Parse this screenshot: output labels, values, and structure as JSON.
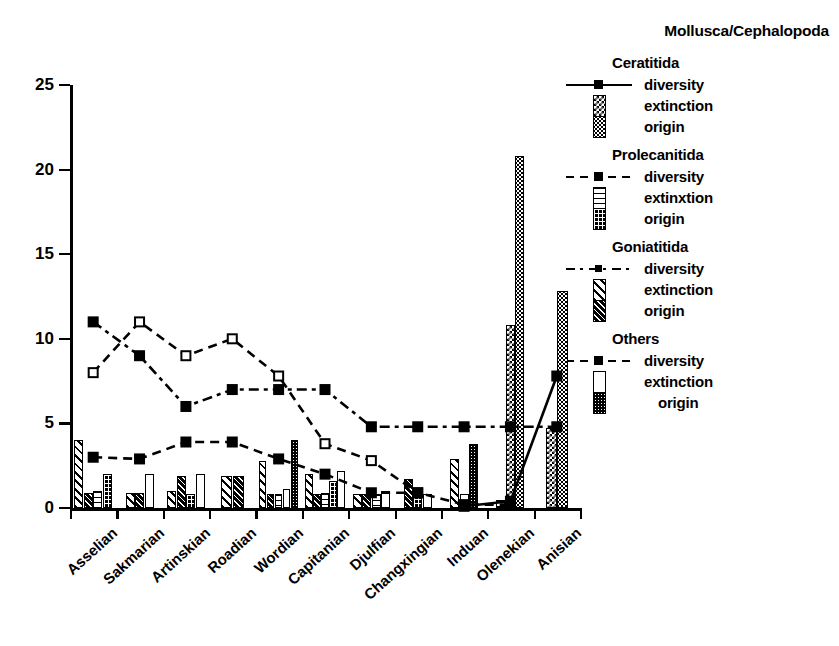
{
  "legend": {
    "title": "Mollusca/Cephalopoda",
    "groups": [
      {
        "name": "Ceratitida",
        "entries": [
          {
            "label": "diversity",
            "key": "line-solid-square",
            "icon": "solid-line-marker-icon"
          },
          {
            "label": "extinction",
            "key": "swatch-checker",
            "icon": "checker-swatch-icon"
          },
          {
            "label": "origin",
            "key": "swatch-dark-dotted",
            "icon": "dark-dotted-swatch-icon"
          }
        ]
      },
      {
        "name": "Prolecanitida",
        "entries": [
          {
            "label": "diversity",
            "key": "line-dash-square",
            "icon": "dashed-line-marker-icon"
          },
          {
            "label": "extinxtion",
            "key": "swatch-hlines",
            "icon": "horizontal-lines-swatch-icon"
          },
          {
            "label": "origin",
            "key": "swatch-dark-grid",
            "icon": "dark-grid-swatch-icon"
          }
        ]
      },
      {
        "name": "Goniatitida",
        "entries": [
          {
            "label": "diversity",
            "key": "line-dashdot-square",
            "icon": "dash-dot-line-marker-icon"
          },
          {
            "label": "extinction",
            "key": "swatch-diagonal",
            "icon": "diagonal-hatch-swatch-icon"
          },
          {
            "label": "origin",
            "key": "swatch-dark-diagonal",
            "icon": "dark-diagonal-swatch-icon"
          }
        ]
      },
      {
        "name": "Others",
        "entries": [
          {
            "label": "diversity",
            "key": "line-dash-square2",
            "icon": "dashed-line-marker-icon"
          },
          {
            "label": "extinction",
            "key": "swatch-white",
            "icon": "white-swatch-icon"
          },
          {
            "label": "origin",
            "key": "swatch-dark-stipple",
            "icon": "dark-stipple-swatch-icon"
          }
        ]
      }
    ]
  },
  "chart_data": {
    "type": "bar",
    "title": "Mollusca/Cephalopoda",
    "xlabel": "",
    "ylabel": "",
    "ylim": [
      0,
      25
    ],
    "yticks": [
      0,
      5,
      10,
      15,
      20,
      25
    ],
    "grid": false,
    "legend_position": "right",
    "categories": [
      "Asselian",
      "Sakmarian",
      "Artinskian",
      "Roadian",
      "Wordian",
      "Capitanian",
      "Djulfian",
      "Changxingian",
      "Induan",
      "Olenekian",
      "Anisian"
    ],
    "bar_series": [
      {
        "name": "Goniatitida extinction",
        "pattern": "diagonal",
        "values": [
          4.0,
          0.9,
          1.0,
          1.9,
          2.8,
          2.0,
          0.8,
          0.0,
          2.9,
          0.0,
          0.0
        ]
      },
      {
        "name": "Goniatitida origin",
        "pattern": "dark-diagonal",
        "values": [
          0.9,
          0.9,
          1.9,
          1.9,
          0.8,
          0.8,
          0.8,
          1.7,
          0.0,
          0.0,
          0.0
        ]
      },
      {
        "name": "Prolecanitida extinxtion",
        "pattern": "horizontal-lines",
        "values": [
          1.0,
          0.0,
          0.0,
          0.0,
          0.8,
          0.9,
          0.8,
          0.0,
          0.0,
          0.5,
          0.0
        ]
      },
      {
        "name": "Prolecanitida origin",
        "pattern": "dark-grid",
        "values": [
          2.0,
          0.0,
          0.8,
          0.0,
          0.0,
          1.6,
          0.0,
          0.8,
          0.0,
          0.0,
          0.0
        ]
      },
      {
        "name": "Others extinction",
        "pattern": "white",
        "values": [
          0.0,
          2.0,
          2.0,
          0.0,
          1.1,
          2.2,
          1.0,
          0.8,
          0.8,
          0.0,
          0.0
        ]
      },
      {
        "name": "Others origin",
        "pattern": "dark-stipple",
        "values": [
          0.0,
          0.0,
          0.0,
          0.0,
          4.0,
          0.0,
          0.0,
          0.0,
          3.8,
          0.0,
          0.0
        ]
      },
      {
        "name": "Ceratitida extinction",
        "pattern": "checker",
        "values": [
          0.0,
          0.0,
          0.0,
          0.0,
          0.0,
          0.0,
          0.0,
          0.0,
          0.0,
          10.8,
          4.7
        ]
      },
      {
        "name": "Ceratitida origin",
        "pattern": "dark-dotted",
        "values": [
          0.0,
          0.0,
          0.0,
          0.0,
          0.0,
          0.0,
          0.0,
          0.0,
          0.0,
          20.8,
          12.8
        ]
      }
    ],
    "line_series": [
      {
        "name": "Ceratitida diversity",
        "style": "solid",
        "marker": "filled-square",
        "values": [
          null,
          null,
          null,
          null,
          null,
          null,
          null,
          null,
          0.1,
          0.4,
          7.8
        ]
      },
      {
        "name": "Prolecanitida diversity",
        "style": "dashed",
        "marker": "open-square",
        "values": [
          8.0,
          11.0,
          9.0,
          10.0,
          7.8,
          3.8,
          2.8,
          0.9,
          null,
          null,
          null
        ]
      },
      {
        "name": "Goniatitida diversity",
        "style": "dash-dot",
        "marker": "filled-square",
        "values": [
          11.0,
          9.0,
          6.0,
          7.0,
          7.0,
          7.0,
          4.8,
          4.8,
          4.8,
          4.8,
          4.8
        ]
      },
      {
        "name": "Others diversity",
        "style": "dashed",
        "marker": "filled-square",
        "values": [
          3.0,
          2.9,
          3.9,
          3.9,
          2.9,
          2.0,
          0.9,
          0.9,
          0.2,
          0.2,
          null
        ]
      }
    ]
  }
}
